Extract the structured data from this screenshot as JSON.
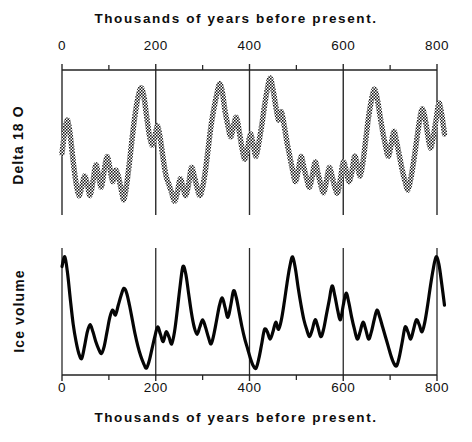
{
  "figure": {
    "caption_top": "Thousands of years before present.",
    "caption_bottom": "Thousands of years before present.",
    "ylabel_top": "Delta 18 O",
    "ylabel_bottom": "Ice volume"
  },
  "axis": {
    "tick_labels": [
      "0",
      "200",
      "400",
      "600",
      "800"
    ]
  },
  "chart_data": {
    "type": "line",
    "title": "Thousands of years before present.",
    "xlabel": "Thousands of years before present.",
    "xlim": [
      0,
      820
    ],
    "grid": true,
    "legend": "none",
    "xticks": [
      0,
      200,
      400,
      600,
      800
    ],
    "xminorticks": [
      100,
      300,
      500,
      700
    ],
    "panels": [
      {
        "name": "delta-18-o",
        "ylabel": "Delta 18 O",
        "ystyle": "inverted-unlabeled",
        "linestyle": "stippled-thick",
        "ylim": [
          0,
          1
        ],
        "x": [
          0,
          6,
          12,
          18,
          24,
          30,
          36,
          42,
          48,
          54,
          60,
          66,
          72,
          78,
          84,
          90,
          96,
          102,
          108,
          114,
          120,
          126,
          132,
          138,
          144,
          150,
          156,
          162,
          168,
          174,
          180,
          186,
          192,
          198,
          204,
          210,
          216,
          222,
          228,
          234,
          240,
          246,
          252,
          258,
          264,
          270,
          276,
          282,
          288,
          294,
          300,
          306,
          312,
          318,
          324,
          330,
          336,
          342,
          348,
          354,
          360,
          366,
          372,
          378,
          384,
          390,
          396,
          402,
          408,
          414,
          420,
          426,
          432,
          438,
          444,
          450,
          456,
          462,
          468,
          474,
          480,
          486,
          492,
          498,
          504,
          510,
          516,
          522,
          528,
          534,
          540,
          546,
          552,
          558,
          564,
          570,
          576,
          582,
          588,
          594,
          600,
          606,
          612,
          618,
          624,
          630,
          636,
          642,
          648,
          654,
          660,
          666,
          672,
          678,
          684,
          690,
          696,
          702,
          708,
          714,
          720,
          726,
          732,
          738,
          744,
          750,
          756,
          762,
          768,
          774,
          780,
          786,
          792,
          798,
          804,
          810,
          816
        ],
        "y": [
          0.46,
          0.62,
          0.7,
          0.58,
          0.4,
          0.25,
          0.16,
          0.22,
          0.3,
          0.24,
          0.16,
          0.26,
          0.38,
          0.3,
          0.22,
          0.34,
          0.44,
          0.36,
          0.26,
          0.34,
          0.3,
          0.21,
          0.13,
          0.24,
          0.4,
          0.58,
          0.74,
          0.86,
          0.93,
          0.88,
          0.74,
          0.6,
          0.52,
          0.58,
          0.66,
          0.56,
          0.42,
          0.3,
          0.24,
          0.18,
          0.12,
          0.18,
          0.28,
          0.22,
          0.16,
          0.24,
          0.36,
          0.3,
          0.22,
          0.16,
          0.22,
          0.34,
          0.5,
          0.66,
          0.78,
          0.88,
          0.96,
          0.9,
          0.76,
          0.66,
          0.58,
          0.66,
          0.72,
          0.62,
          0.5,
          0.42,
          0.5,
          0.6,
          0.52,
          0.44,
          0.54,
          0.66,
          0.8,
          0.92,
          1.0,
          0.92,
          0.8,
          0.7,
          0.76,
          0.66,
          0.54,
          0.44,
          0.34,
          0.26,
          0.34,
          0.44,
          0.36,
          0.28,
          0.22,
          0.3,
          0.4,
          0.32,
          0.24,
          0.18,
          0.26,
          0.36,
          0.3,
          0.22,
          0.18,
          0.28,
          0.4,
          0.34,
          0.26,
          0.32,
          0.44,
          0.38,
          0.3,
          0.4,
          0.56,
          0.72,
          0.84,
          0.92,
          0.86,
          0.74,
          0.62,
          0.52,
          0.44,
          0.52,
          0.62,
          0.54,
          0.44,
          0.34,
          0.26,
          0.2,
          0.28,
          0.4,
          0.54,
          0.68,
          0.78,
          0.72,
          0.6,
          0.5,
          0.58,
          0.7,
          0.82,
          0.74,
          0.6,
          0.48,
          0.4
        ]
      },
      {
        "name": "ice-volume",
        "ylabel": "Ice volume",
        "ystyle": "unlabeled",
        "linestyle": "solid-thick",
        "ylim": [
          0,
          1
        ],
        "x": [
          0,
          6,
          12,
          18,
          24,
          30,
          36,
          42,
          48,
          54,
          60,
          66,
          72,
          78,
          84,
          90,
          96,
          102,
          108,
          114,
          120,
          126,
          132,
          138,
          144,
          150,
          156,
          162,
          168,
          174,
          180,
          186,
          192,
          198,
          204,
          210,
          216,
          222,
          228,
          234,
          240,
          246,
          252,
          258,
          264,
          270,
          276,
          282,
          288,
          294,
          300,
          306,
          312,
          318,
          324,
          330,
          336,
          342,
          348,
          354,
          360,
          366,
          372,
          378,
          384,
          390,
          396,
          402,
          408,
          414,
          420,
          426,
          432,
          438,
          444,
          450,
          456,
          462,
          468,
          474,
          480,
          486,
          492,
          498,
          504,
          510,
          516,
          522,
          528,
          534,
          540,
          546,
          552,
          558,
          564,
          570,
          576,
          582,
          588,
          594,
          600,
          606,
          612,
          618,
          624,
          630,
          636,
          642,
          648,
          654,
          660,
          666,
          672,
          678,
          684,
          690,
          696,
          702,
          708,
          714,
          720,
          726,
          732,
          738,
          744,
          750,
          756,
          762,
          768,
          774,
          780,
          786,
          792,
          798,
          804,
          810,
          816
        ],
        "y": [
          0.88,
          0.96,
          0.82,
          0.6,
          0.4,
          0.26,
          0.16,
          0.12,
          0.22,
          0.34,
          0.4,
          0.34,
          0.26,
          0.2,
          0.16,
          0.22,
          0.34,
          0.46,
          0.52,
          0.48,
          0.56,
          0.64,
          0.7,
          0.66,
          0.56,
          0.44,
          0.32,
          0.22,
          0.14,
          0.08,
          0.04,
          0.1,
          0.2,
          0.3,
          0.38,
          0.32,
          0.26,
          0.34,
          0.3,
          0.24,
          0.34,
          0.52,
          0.72,
          0.88,
          0.82,
          0.66,
          0.5,
          0.38,
          0.32,
          0.38,
          0.44,
          0.38,
          0.3,
          0.24,
          0.32,
          0.44,
          0.56,
          0.62,
          0.54,
          0.46,
          0.56,
          0.68,
          0.62,
          0.5,
          0.38,
          0.28,
          0.2,
          0.12,
          0.06,
          0.04,
          0.12,
          0.24,
          0.36,
          0.34,
          0.28,
          0.34,
          0.42,
          0.36,
          0.44,
          0.58,
          0.74,
          0.88,
          0.96,
          0.86,
          0.7,
          0.56,
          0.44,
          0.36,
          0.3,
          0.36,
          0.44,
          0.38,
          0.3,
          0.36,
          0.48,
          0.6,
          0.72,
          0.64,
          0.52,
          0.44,
          0.56,
          0.66,
          0.58,
          0.46,
          0.36,
          0.28,
          0.34,
          0.42,
          0.36,
          0.28,
          0.34,
          0.44,
          0.52,
          0.46,
          0.38,
          0.3,
          0.22,
          0.14,
          0.08,
          0.06,
          0.14,
          0.26,
          0.38,
          0.34,
          0.28,
          0.36,
          0.44,
          0.4,
          0.34,
          0.42,
          0.56,
          0.72,
          0.86,
          0.96,
          0.9,
          0.74,
          0.56,
          0.4,
          0.3
        ]
      }
    ]
  }
}
